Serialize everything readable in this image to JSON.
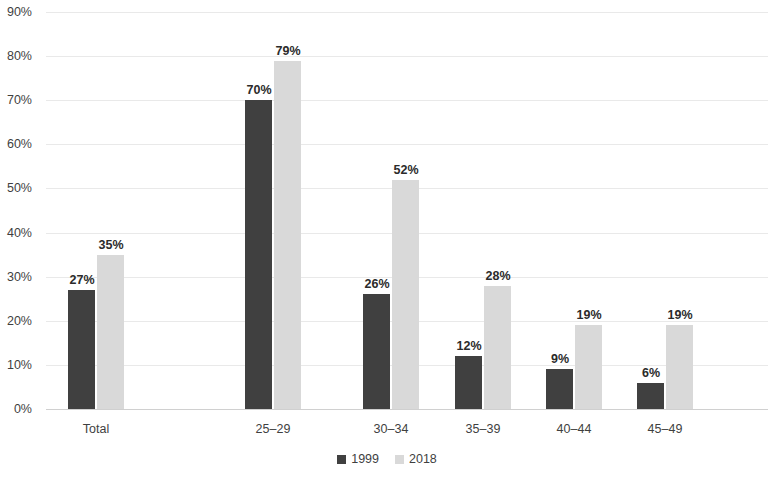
{
  "chart_data": {
    "type": "bar",
    "title": "",
    "subtitle": "",
    "xlabel": "",
    "ylabel": "",
    "ylim": [
      0,
      90
    ],
    "ytick_step": 10,
    "ytick_labels": [
      "0%",
      "10%",
      "20%",
      "30%",
      "40%",
      "50%",
      "60%",
      "70%",
      "80%",
      "90%"
    ],
    "ytick_values": [
      0,
      10,
      20,
      30,
      40,
      50,
      60,
      70,
      80,
      90
    ],
    "grid": true,
    "grid_axis": "y",
    "legend_position": "bottom",
    "value_labels_suffix": "%",
    "categories": [
      "Total",
      "25–29",
      "30–34",
      "35–39",
      "40–44",
      "45–49"
    ],
    "series": [
      {
        "name": "1999",
        "color": "#404040",
        "values": [
          27,
          70,
          26,
          12,
          9,
          6
        ],
        "value_labels": [
          "27%",
          "70%",
          "26%",
          "12%",
          "9%",
          "6%"
        ]
      },
      {
        "name": "2018",
        "color": "#D9D9D9",
        "values": [
          35,
          79,
          52,
          28,
          19,
          19
        ],
        "value_labels": [
          "35%",
          "79%",
          "52%",
          "28%",
          "19%",
          "19%"
        ]
      }
    ]
  },
  "colors": {
    "background": "#FFFFFF",
    "gridline": "#E9E9E9",
    "axis": "#D0D0D0",
    "text": "#3F3F3F",
    "label_text": "#2B2B2B"
  }
}
